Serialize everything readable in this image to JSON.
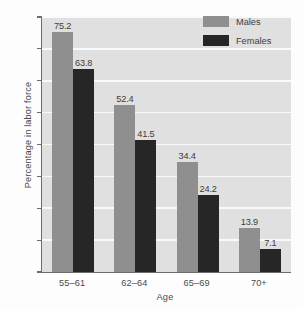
{
  "chart_data": {
    "type": "bar",
    "title": "",
    "subtitle": "",
    "xlabel": "Age",
    "ylabel": "Percentage in labor force",
    "categories": [
      "55–61",
      "62–64",
      "65–69",
      "70+"
    ],
    "series": [
      {
        "name": "Males",
        "color": "#8f8f8f",
        "values": [
          75.2,
          52.4,
          34.4,
          13.9
        ]
      },
      {
        "name": "Females",
        "color": "#262626",
        "values": [
          63.8,
          41.5,
          24.2,
          7.1
        ]
      }
    ],
    "ylim": [
      0,
      80
    ],
    "ytick_labels": [
      "0",
      "10",
      "20",
      "30",
      "40",
      "50",
      "60",
      "70",
      "80"
    ],
    "ytick_values": [
      0,
      10,
      20,
      30,
      40,
      50,
      60,
      70,
      80
    ],
    "grid": "horizontal",
    "gridline_color": "#fafafa",
    "plot_background": "#e0e0e0",
    "legend_position": "top-right",
    "data_labels": [
      "75.2",
      "63.8",
      "52.4",
      "41.5",
      "34.4",
      "24.2",
      "13.9",
      "7.1"
    ]
  }
}
